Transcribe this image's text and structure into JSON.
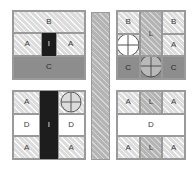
{
  "diagram": {
    "colors": {
      "light_hatch": "#dcdcdc",
      "mid_hatch": "#b4b4b4",
      "dark_solid": "#8d8d8d",
      "black_solid": "#1d1d1d",
      "white_solid": "#ffffff",
      "outline": "#9a9a9a",
      "label_text": "#3a3a3a",
      "label_text_inverse": "#e8e8e8",
      "background": "#ffffff"
    },
    "panels": [
      {
        "name": "top-left",
        "cells": [
          {
            "label": "B",
            "fill": "light-hatch"
          },
          {
            "label": "A",
            "fill": "light-hatch"
          },
          {
            "label": "I",
            "fill": "black-solid"
          },
          {
            "label": "A",
            "fill": "light-hatch"
          },
          {
            "label": "C",
            "fill": "dark-solid"
          }
        ],
        "markers": []
      },
      {
        "name": "bottom-left",
        "cells": [
          {
            "label": "A",
            "fill": "light-hatch"
          },
          {
            "label": "I",
            "fill": "black-solid"
          },
          {
            "label": "",
            "fill": "light-hatch"
          },
          {
            "label": "D",
            "fill": "white-solid"
          },
          {
            "label": "D",
            "fill": "white-solid"
          },
          {
            "label": "A",
            "fill": "light-hatch"
          },
          {
            "label": "A",
            "fill": "light-hatch"
          }
        ],
        "markers": [
          {
            "name": "crosshair-circle",
            "fill": "light-hatch",
            "position": "top-right-cell"
          }
        ]
      },
      {
        "name": "top-right",
        "cells": [
          {
            "label": "B",
            "fill": "light-hatch"
          },
          {
            "label": "L",
            "fill": "mid-hatch"
          },
          {
            "label": "B",
            "fill": "light-hatch"
          },
          {
            "label": "",
            "fill": "light-hatch"
          },
          {
            "label": "A",
            "fill": "light-hatch"
          },
          {
            "label": "C",
            "fill": "dark-solid"
          },
          {
            "label": "C",
            "fill": "dark-solid"
          },
          {
            "label": "C",
            "fill": "dark-solid"
          }
        ],
        "markers": [
          {
            "name": "crosshair-circle",
            "fill": "white-solid",
            "position": "middle-left-cell"
          },
          {
            "name": "crosshair-circle",
            "fill": "mid-hatch",
            "position": "bottom-center-cell"
          }
        ]
      },
      {
        "name": "bottom-right",
        "cells": [
          {
            "label": "A",
            "fill": "light-hatch"
          },
          {
            "label": "L",
            "fill": "mid-hatch"
          },
          {
            "label": "A",
            "fill": "light-hatch"
          },
          {
            "label": "D",
            "fill": "white-solid"
          },
          {
            "label": "A",
            "fill": "light-hatch"
          },
          {
            "label": "L",
            "fill": "mid-hatch"
          },
          {
            "label": "A",
            "fill": "light-hatch"
          }
        ],
        "markers": []
      }
    ],
    "center_bar": {
      "name": "center-divider-bar",
      "fill": "mid-hatch",
      "label": ""
    },
    "labels": {
      "A": "A",
      "B": "B",
      "C": "C",
      "D": "D",
      "I": "I",
      "L": "L",
      "empty": ""
    }
  }
}
